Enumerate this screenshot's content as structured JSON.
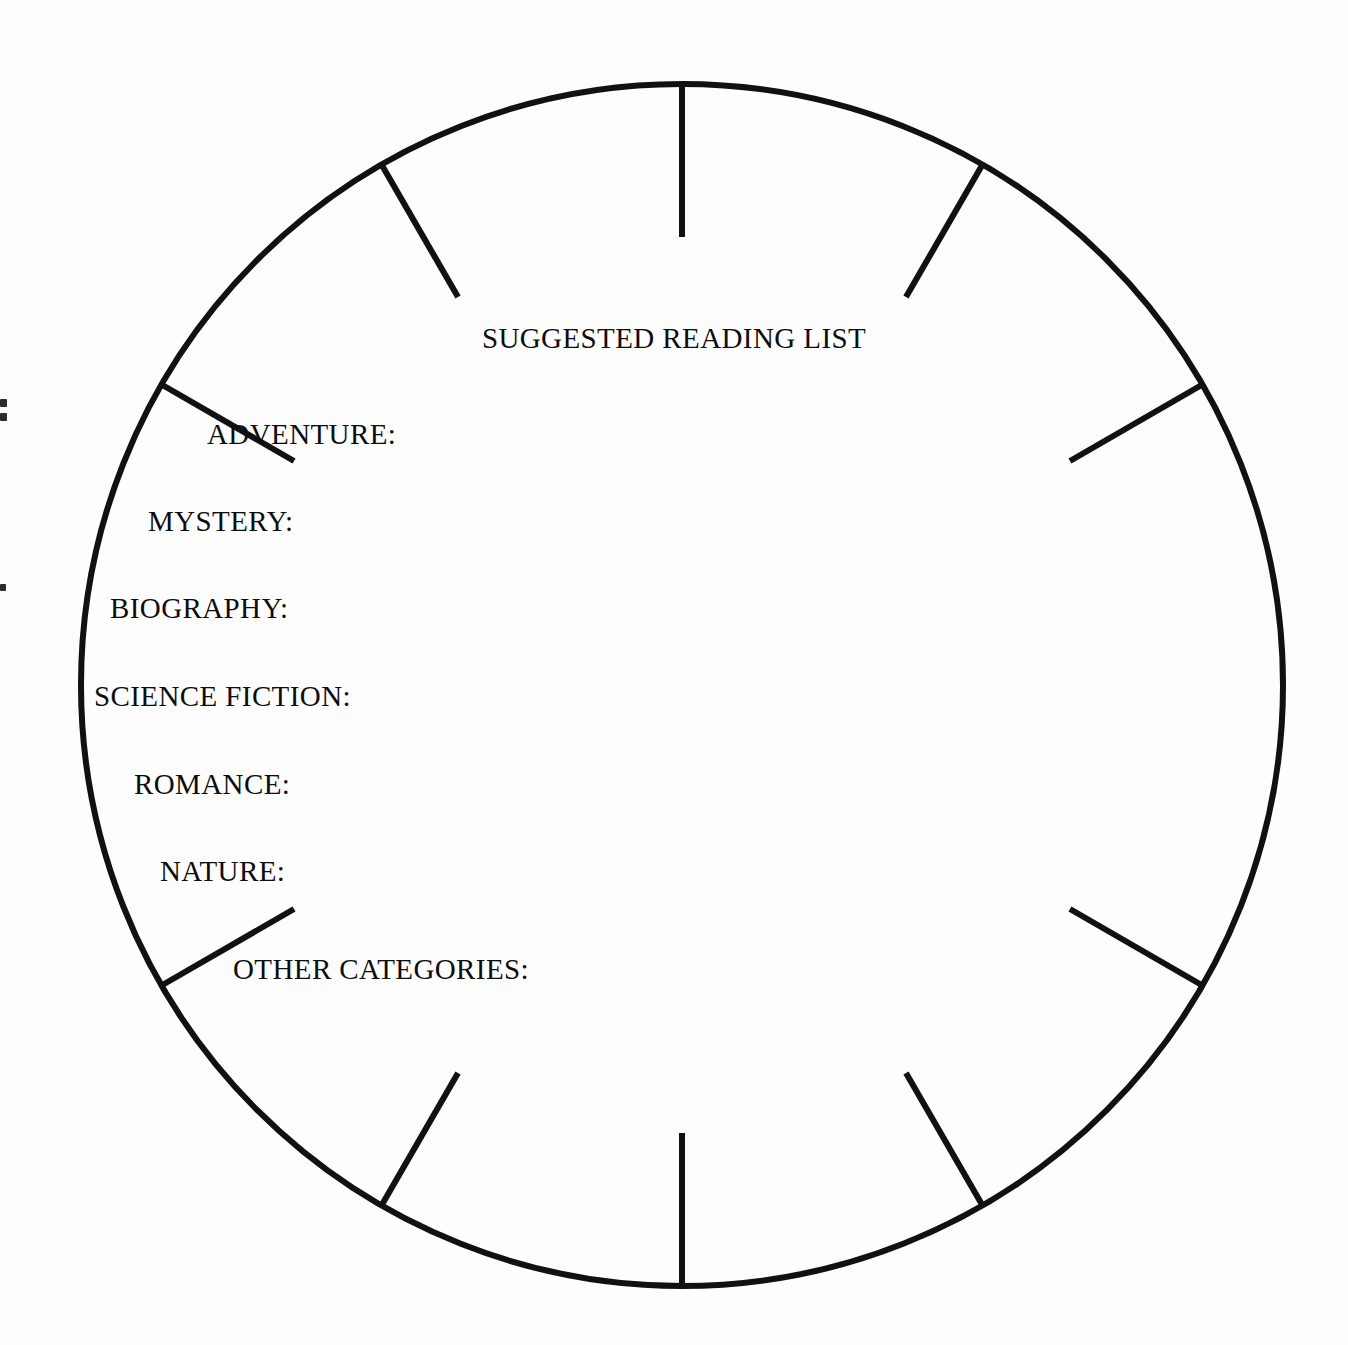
{
  "page": {
    "background_color": "#fdfdfd",
    "ink_color": "#0d0d0d",
    "width": 1348,
    "height": 1345
  },
  "worksheet": {
    "title": "SUGGESTED READING LIST",
    "shape": "circle",
    "categories": [
      {
        "label": "ADVENTURE:",
        "left": 207,
        "top": 418
      },
      {
        "label": "MYSTERY:",
        "left": 148,
        "top": 505
      },
      {
        "label": "BIOGRAPHY:",
        "left": 110,
        "top": 592
      },
      {
        "label": "SCIENCE FICTION:",
        "left": 94,
        "top": 680
      },
      {
        "label": "ROMANCE:",
        "left": 134,
        "top": 768
      },
      {
        "label": "NATURE:",
        "left": 160,
        "top": 855
      },
      {
        "label": "OTHER CATEGORIES:",
        "left": 233,
        "top": 953
      }
    ]
  },
  "wheel": {
    "center_x": 682,
    "center_y": 685,
    "radius": 601,
    "stroke_width": 6,
    "tick_length": 153,
    "tick_stroke_width": 6,
    "tick_angles_deg": [
      90,
      60,
      30,
      -30,
      -60,
      -90,
      -120,
      -150,
      150,
      120
    ],
    "tick_count": 10
  },
  "scan_marks": [
    {
      "left": 0,
      "top": 399,
      "width": 7,
      "height": 8
    },
    {
      "left": 0,
      "top": 413,
      "width": 7,
      "height": 8
    },
    {
      "left": 0,
      "top": 584,
      "width": 6,
      "height": 7
    }
  ]
}
